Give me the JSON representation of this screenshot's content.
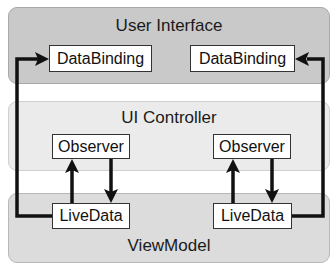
{
  "diagram": {
    "layers": [
      {
        "id": "user-interface",
        "title": "User Interface",
        "fill": "#c9c9c9"
      },
      {
        "id": "ui-controller",
        "title": "UI Controller",
        "fill": "#ebebeb"
      },
      {
        "id": "viewmodel",
        "title": "ViewModel",
        "fill": "#dcdcdc"
      }
    ],
    "nodes": {
      "databinding_left": "DataBinding",
      "databinding_right": "DataBinding",
      "observer_left": "Observer",
      "observer_right": "Observer",
      "livedata_left": "LiveData",
      "livedata_right": "LiveData"
    },
    "edges": [
      {
        "from": "livedata_left",
        "to": "databinding_left"
      },
      {
        "from": "livedata_right",
        "to": "databinding_right"
      },
      {
        "from": "livedata_left",
        "to": "observer_left"
      },
      {
        "from": "observer_left",
        "to": "livedata_left"
      },
      {
        "from": "livedata_right",
        "to": "observer_right"
      },
      {
        "from": "observer_right",
        "to": "livedata_right"
      }
    ],
    "line_color": "#111111"
  }
}
